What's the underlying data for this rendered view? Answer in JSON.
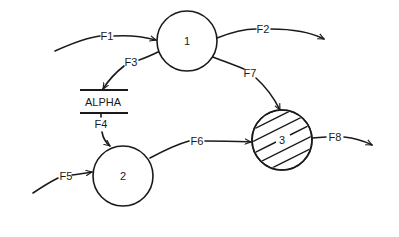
{
  "diagram": {
    "type": "data-flow-diagram",
    "colors": {
      "ink": "#1a1a1a",
      "background": "#ffffff"
    },
    "processes": [
      {
        "id": "1",
        "label": "1",
        "cx": 187,
        "cy": 41,
        "r": 30,
        "hatched": false
      },
      {
        "id": "2",
        "label": "2",
        "cx": 123,
        "cy": 176,
        "r": 30,
        "hatched": false
      },
      {
        "id": "3",
        "label": "3",
        "cx": 282,
        "cy": 140,
        "r": 30,
        "hatched": true
      }
    ],
    "data_stores": [
      {
        "id": "alpha",
        "label": "ALPHA",
        "x1": 80,
        "x2": 128,
        "y_top": 90,
        "y_bottom": 113
      }
    ],
    "flows": [
      {
        "id": "F1",
        "label": "F1",
        "from": "external",
        "to": "1"
      },
      {
        "id": "F2",
        "label": "F2",
        "from": "1",
        "to": "external"
      },
      {
        "id": "F3",
        "label": "F3",
        "from": "1",
        "to": "ALPHA"
      },
      {
        "id": "F4",
        "label": "F4",
        "from": "ALPHA",
        "to": "2"
      },
      {
        "id": "F5",
        "label": "F5",
        "from": "external",
        "to": "2"
      },
      {
        "id": "F6",
        "label": "F6",
        "from": "2",
        "to": "3"
      },
      {
        "id": "F7",
        "label": "F7",
        "from": "1",
        "to": "3"
      },
      {
        "id": "F8",
        "label": "F8",
        "from": "3",
        "to": "external"
      }
    ]
  }
}
